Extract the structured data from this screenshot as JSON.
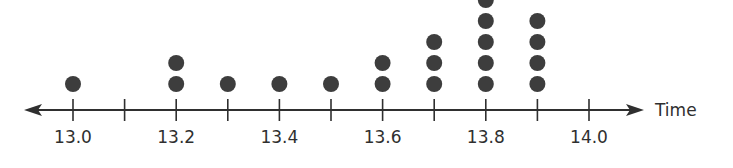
{
  "chart_data": {
    "type": "dot_plot",
    "title": "",
    "xlabel": "Time",
    "ylabel": "",
    "xlim": [
      12.93,
      14.25
    ],
    "tick_values": [
      13.0,
      13.1,
      13.2,
      13.3,
      13.4,
      13.5,
      13.6,
      13.7,
      13.8,
      13.9,
      14.0
    ],
    "tick_labels": [
      {
        "value": 13.0,
        "label": "13.0"
      },
      {
        "value": 13.2,
        "label": "13.2"
      },
      {
        "value": 13.4,
        "label": "13.4"
      },
      {
        "value": 13.6,
        "label": "13.6"
      },
      {
        "value": 13.8,
        "label": "13.8"
      },
      {
        "value": 14.0,
        "label": "14.0"
      }
    ],
    "categories": [
      "13.0",
      "13.1",
      "13.2",
      "13.3",
      "13.4",
      "13.5",
      "13.6",
      "13.7",
      "13.8",
      "13.9",
      "14.0"
    ],
    "values": [
      1,
      0,
      2,
      1,
      1,
      1,
      2,
      3,
      5,
      4,
      0
    ],
    "grid": false,
    "legend": null,
    "arrows": "both"
  },
  "colors": {
    "dot": "#3d3d3d",
    "axis": "#2f2f2f",
    "text": "#2f2f2f",
    "background": "#ffffff"
  }
}
